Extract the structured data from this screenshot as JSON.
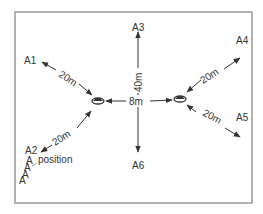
{
  "diagram": {
    "frame": {
      "x": 15,
      "y": 12,
      "width": 237,
      "height": 191,
      "color": "#9a9a9a"
    },
    "line_color": "#333333",
    "sources": [
      {
        "name": "left-loudspeaker",
        "x": 98,
        "y": 101
      },
      {
        "name": "right-loudspeaker",
        "x": 180,
        "y": 99
      }
    ],
    "positions": [
      {
        "id": "A1",
        "label": "A1",
        "x": 30,
        "y": 58
      },
      {
        "id": "A2",
        "label": "A2",
        "x": 30,
        "y": 161
      },
      {
        "id": "A3",
        "label": "A3",
        "x": 138,
        "y": 27
      },
      {
        "id": "A4",
        "label": "A4",
        "x": 242,
        "y": 40
      },
      {
        "id": "A5",
        "label": "A5",
        "x": 239,
        "y": 117
      },
      {
        "id": "A6",
        "label": "A6",
        "x": 138,
        "y": 165
      }
    ],
    "distances": {
      "a1": "20m",
      "a2": "20m",
      "a4": "20m",
      "a5": "20m",
      "vertical": "40m",
      "horizontal": "8m"
    },
    "legend": {
      "glyph": "A",
      "label": "position"
    }
  }
}
